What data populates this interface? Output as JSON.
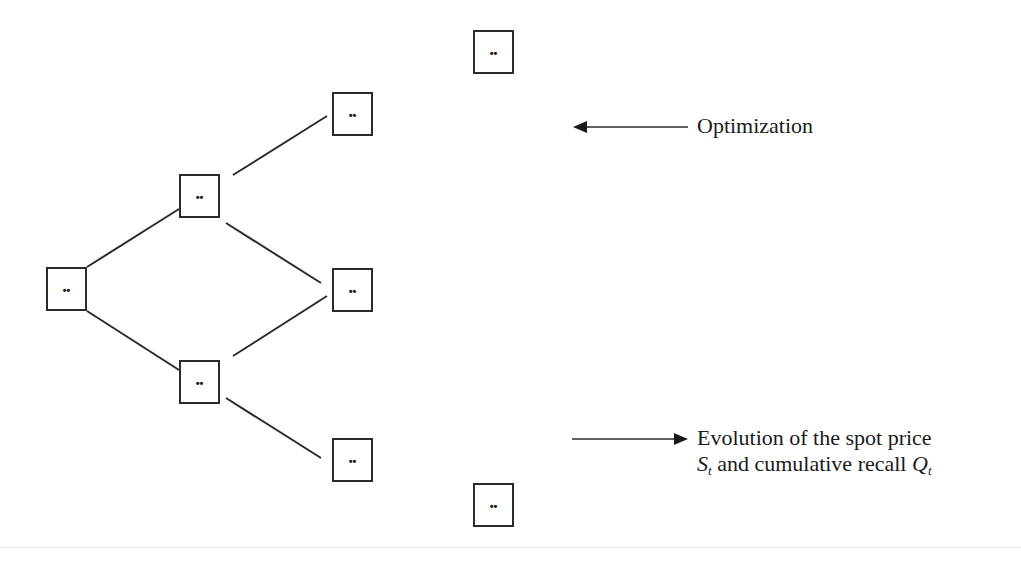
{
  "diagram": {
    "type": "binomial-tree",
    "node_symbol": "••",
    "nodes": [
      {
        "id": "root",
        "label": "••",
        "x": 46,
        "y": 267
      },
      {
        "id": "l1-up",
        "label": "••",
        "x": 179,
        "y": 174
      },
      {
        "id": "l1-down",
        "label": "••",
        "x": 179,
        "y": 360
      },
      {
        "id": "l2-up",
        "label": "••",
        "x": 332,
        "y": 92
      },
      {
        "id": "l2-mid",
        "label": "••",
        "x": 332,
        "y": 268
      },
      {
        "id": "l2-down",
        "label": "••",
        "x": 332,
        "y": 438
      },
      {
        "id": "l3-top",
        "label": "••",
        "x": 473,
        "y": 30
      },
      {
        "id": "l3-bottom",
        "label": "••",
        "x": 473,
        "y": 483
      }
    ],
    "edges": [
      {
        "from": "root",
        "to": "l1-up"
      },
      {
        "from": "root",
        "to": "l1-down"
      },
      {
        "from": "l1-up",
        "to": "l2-up"
      },
      {
        "from": "l1-up",
        "to": "l2-mid"
      },
      {
        "from": "l1-down",
        "to": "l2-mid"
      },
      {
        "from": "l1-down",
        "to": "l2-down"
      }
    ],
    "annotations": {
      "optimization": {
        "text": "Optimization",
        "arrow_direction": "left"
      },
      "evolution": {
        "line1": "Evolution of the spot price",
        "s_symbol": "S",
        "s_subscript": "t",
        "middle_text": " and cumulative recall ",
        "q_symbol": "Q",
        "q_subscript": "t",
        "arrow_direction": "right"
      }
    },
    "colors": {
      "stroke": "#2b2b2b",
      "text": "#1a1a1a",
      "background": "#ffffff"
    }
  }
}
